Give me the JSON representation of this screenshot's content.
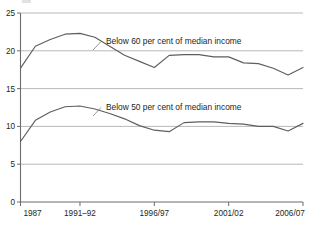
{
  "chart_data": {
    "type": "line",
    "title": "",
    "subtitle": "",
    "xlabel": "",
    "ylabel": "",
    "ylim": [
      0,
      25
    ],
    "yticks": [
      0,
      5,
      10,
      15,
      20,
      25
    ],
    "ytick_labels": [
      "0",
      "5",
      "10",
      "15",
      "20",
      "25"
    ],
    "grid": true,
    "grid_axis": "y",
    "legend": "inline-labels",
    "x": [
      "1987",
      "1988-89",
      "1989-90",
      "1990-91",
      "1991-92",
      "1992-93",
      "1993-94",
      "1994/95",
      "1995/96",
      "1996/97",
      "1997/98",
      "1998/99",
      "1999/00",
      "2000/01",
      "2001/02",
      "2002/03",
      "2003/04",
      "2004/05",
      "2005/06",
      "2006/07"
    ],
    "xtick_labels": [
      "1987",
      "1991–92",
      "1996/97",
      "2001/02",
      "2006/07"
    ],
    "xtick_positions": [
      0,
      4,
      9,
      14,
      19
    ],
    "series": [
      {
        "name": "Below 60 per cent of median income",
        "color": "#5e5e5e",
        "label_anchor_index": 6,
        "values": [
          17.7,
          20.6,
          21.5,
          22.2,
          22.3,
          21.8,
          20.6,
          19.4,
          18.6,
          17.8,
          19.4,
          19.5,
          19.5,
          19.2,
          19.2,
          18.4,
          18.3,
          17.7,
          16.8,
          17.8
        ]
      },
      {
        "name": "Below 50 per cent of median income",
        "color": "#5e5e5e",
        "label_anchor_index": 6,
        "values": [
          8.0,
          10.8,
          11.9,
          12.6,
          12.7,
          12.3,
          11.7,
          11.0,
          10.1,
          9.5,
          9.3,
          10.5,
          10.6,
          10.6,
          10.4,
          10.3,
          10.0,
          10.0,
          9.4,
          10.4
        ]
      }
    ],
    "annotations": [
      {
        "text": "Below 60 per cent of median income",
        "x": 106,
        "y": 44
      },
      {
        "text": "Below 50 per cent of median income",
        "x": 106,
        "y": 110
      }
    ]
  }
}
